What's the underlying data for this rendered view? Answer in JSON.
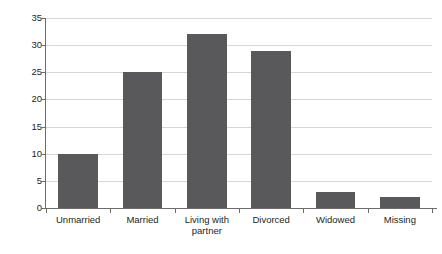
{
  "figure": {
    "caption_fragment": "",
    "background_color": "#ffffff"
  },
  "chart_data": {
    "type": "bar",
    "title": "",
    "xlabel": "",
    "ylabel": "",
    "categories": [
      "Unmarried",
      "Married",
      "Living with partner",
      "Divorced",
      "Widowed",
      "Missing"
    ],
    "values": [
      10,
      25,
      32,
      29,
      3,
      2
    ],
    "ylim": [
      0,
      35
    ],
    "yticks": [
      0,
      5,
      10,
      15,
      20,
      25,
      30,
      35
    ],
    "ytick_labels": [
      "0",
      "5",
      "10",
      "15",
      "20",
      "25",
      "30",
      "35"
    ],
    "grid": true,
    "grid_axis": "y",
    "legend": false,
    "bar_color": "#59595b",
    "gridline_color": "#d7d5d6",
    "axis_color": "#6d6a6b",
    "text_color": "#231f20"
  }
}
